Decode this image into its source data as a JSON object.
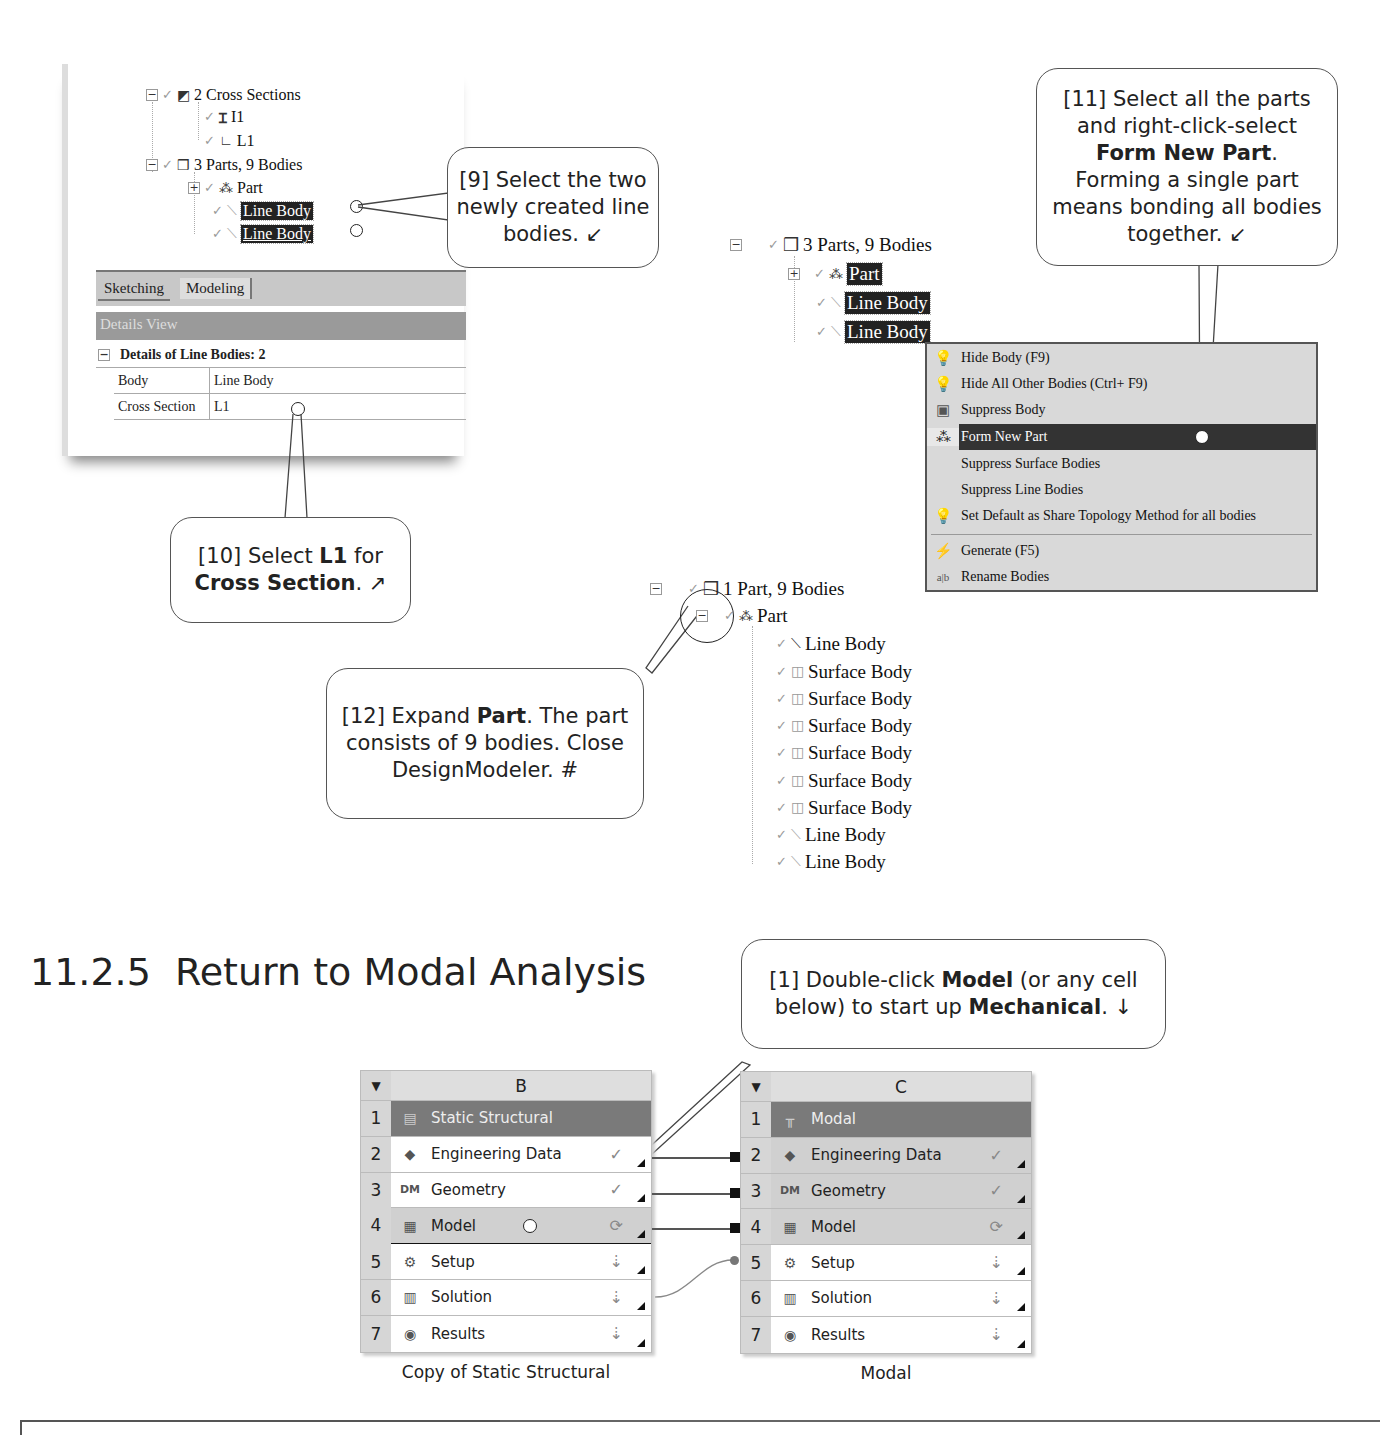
{
  "panel_dm_tree": {
    "cross_sections": {
      "label": "2 Cross Sections",
      "items": [
        "I1",
        "L1"
      ]
    },
    "parts": {
      "label": "3 Parts, 9 Bodies",
      "items": [
        "Part",
        "Line Body",
        "Line Body"
      ]
    },
    "tabs": [
      "Sketching",
      "Modeling"
    ],
    "details_view_title": "Details View",
    "details_header": "Details of Line Bodies: 2",
    "details_rows": [
      {
        "key": "Body",
        "value": "Line Body"
      },
      {
        "key": "Cross Section",
        "value": "L1"
      }
    ]
  },
  "callouts": {
    "c9": {
      "line1": "[9] Select the two",
      "line2": "newly created line",
      "line3": "bodies. ↙"
    },
    "c10": {
      "pre": "[10] Select ",
      "bold1": "L1",
      "mid": " for",
      "bold2": "Cross Section",
      "post": ". ↗"
    },
    "c11": {
      "line1": "[11] Select all the parts",
      "line2": "and right-click-select",
      "bold": "Form New Part",
      "dot": ".",
      "line4": "Forming a single part",
      "line5": "means bonding all bodies",
      "line6": "together. ↙"
    },
    "c12": {
      "pre": "[12] Expand ",
      "bold": "Part",
      "post": ". The part",
      "line2": "consists of 9 bodies.  Close",
      "line3": "DesignModeler. #"
    },
    "c1": {
      "pre": "[1] Double-click ",
      "bold1": "Model",
      "mid": " (or any cell",
      "line2pre": "below) to start up ",
      "bold2": "Mechanical",
      "post": ". ↓"
    }
  },
  "tree_right_top": {
    "root": "3 Parts, 9 Bodies",
    "items": [
      "Part",
      "Line Body",
      "Line Body"
    ]
  },
  "context_menu": {
    "items": [
      {
        "icon": "💡",
        "label": "Hide Body (F9)"
      },
      {
        "icon": "💡",
        "label": "Hide All Other Bodies (Ctrl+ F9)"
      },
      {
        "icon": "▣",
        "label": "Suppress Body"
      },
      {
        "icon": "⁂",
        "label": "Form New Part",
        "highlighted": true
      },
      {
        "icon": "",
        "label": "Suppress Surface Bodies"
      },
      {
        "icon": "",
        "label": "Suppress Line Bodies"
      },
      {
        "icon": "💡",
        "label": "Set Default as Share Topology Method for all bodies"
      },
      {
        "icon": "⚡",
        "label": "Generate (F5)"
      },
      {
        "icon": "a|b",
        "label": "Rename Bodies"
      }
    ]
  },
  "tree_right_bottom": {
    "root": "1 Part, 9 Bodies",
    "part": "Part",
    "bodies": [
      "Line Body",
      "Surface Body",
      "Surface Body",
      "Surface Body",
      "Surface Body",
      "Surface Body",
      "Surface Body",
      "Line Body",
      "Line Body"
    ]
  },
  "section": {
    "number": "11.2.5",
    "title": "Return to Modal Analysis"
  },
  "schematic": {
    "system_b": {
      "column": "B",
      "caption": "Copy of Static Structural",
      "rows": [
        {
          "n": "1",
          "label": "Static Structural",
          "status": ""
        },
        {
          "n": "2",
          "label": "Engineering Data",
          "status": "✓"
        },
        {
          "n": "3",
          "label": "Geometry",
          "status": "✓"
        },
        {
          "n": "4",
          "label": "Model",
          "status": "⟳"
        },
        {
          "n": "5",
          "label": "Setup",
          "status": "⇣"
        },
        {
          "n": "6",
          "label": "Solution",
          "status": "⇣"
        },
        {
          "n": "7",
          "label": "Results",
          "status": "⇣"
        }
      ]
    },
    "system_c": {
      "column": "C",
      "caption": "Modal",
      "rows": [
        {
          "n": "1",
          "label": "Modal",
          "status": ""
        },
        {
          "n": "2",
          "label": "Engineering Data",
          "status": "✓"
        },
        {
          "n": "3",
          "label": "Geometry",
          "status": "✓"
        },
        {
          "n": "4",
          "label": "Model",
          "status": "⟳"
        },
        {
          "n": "5",
          "label": "Setup",
          "status": "⇣"
        },
        {
          "n": "6",
          "label": "Solution",
          "status": "⇣"
        },
        {
          "n": "7",
          "label": "Results",
          "status": "⇣"
        }
      ]
    }
  }
}
